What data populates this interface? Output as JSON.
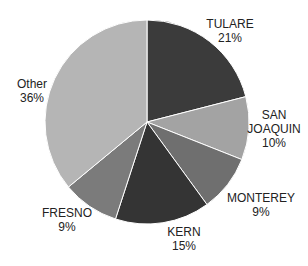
{
  "chart_data": {
    "type": "pie",
    "title": "",
    "categories": [
      "TULARE",
      "SAN JOAQUIN",
      "MONTEREY",
      "KERN",
      "FRESNO",
      "Other"
    ],
    "values": [
      21,
      10,
      9,
      15,
      9,
      36
    ],
    "colors": [
      "#3b3b3b",
      "#a3a3a3",
      "#6f6f6f",
      "#343434",
      "#7b7b7b",
      "#b5b5b5"
    ],
    "start_angle_deg": 0,
    "direction": "clockwise",
    "labels": [
      {
        "name": "TULARE",
        "pct": "21%"
      },
      {
        "name": "SAN JOAQUIN",
        "line1": "SAN",
        "line2": "JOAQUIN",
        "pct": "10%"
      },
      {
        "name": "MONTEREY",
        "pct": "9%"
      },
      {
        "name": "KERN",
        "pct": "15%"
      },
      {
        "name": "FRESNO",
        "pct": "9%"
      },
      {
        "name": "Other",
        "pct": "36%"
      }
    ],
    "legend": "none"
  }
}
